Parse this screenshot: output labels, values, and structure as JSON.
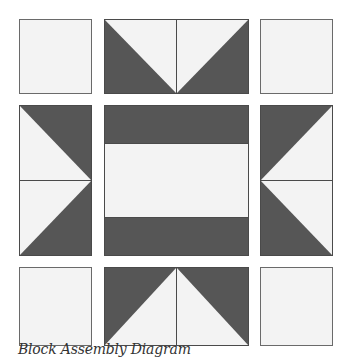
{
  "caption": "Block Assembly Diagram",
  "colors": {
    "dark": "#565656",
    "light": "#f3f3f3",
    "stroke": "#4a4a4a",
    "background": "#ffffff"
  },
  "grid": {
    "rows": 3,
    "cols": 3,
    "columns_x": [
      [
        19,
        91
      ],
      [
        104,
        248
      ],
      [
        260,
        333
      ]
    ],
    "rows_y": [
      [
        19,
        93
      ],
      [
        105,
        255
      ],
      [
        267,
        345
      ]
    ]
  },
  "blocks": [
    {
      "name": "corner-square-top-left",
      "row": 0,
      "col": 0,
      "type": "plain"
    },
    {
      "name": "flying-geese-top",
      "row": 0,
      "col": 1,
      "type": "geese-down"
    },
    {
      "name": "corner-square-top-right",
      "row": 0,
      "col": 2,
      "type": "plain"
    },
    {
      "name": "flying-geese-left",
      "row": 1,
      "col": 0,
      "type": "geese-right"
    },
    {
      "name": "center-striped-block",
      "row": 1,
      "col": 1,
      "type": "stripes"
    },
    {
      "name": "flying-geese-right",
      "row": 1,
      "col": 2,
      "type": "geese-left"
    },
    {
      "name": "corner-square-bottom-left",
      "row": 2,
      "col": 0,
      "type": "plain"
    },
    {
      "name": "flying-geese-bottom",
      "row": 2,
      "col": 1,
      "type": "geese-up"
    },
    {
      "name": "corner-square-bottom-right",
      "row": 2,
      "col": 2,
      "type": "plain"
    }
  ]
}
